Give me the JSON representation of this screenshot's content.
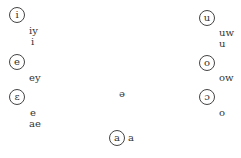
{
  "vowels": {
    "i": {
      "symbol": "i",
      "labels": [
        "iy",
        "i"
      ]
    },
    "e": {
      "symbol": "e",
      "labels": [
        "ey"
      ]
    },
    "eh": {
      "symbol": "ɛ",
      "labels": [
        "e",
        "ae"
      ]
    },
    "u": {
      "symbol": "u",
      "labels": [
        "uw",
        "u"
      ]
    },
    "o": {
      "symbol": "o",
      "labels": [
        "ow"
      ]
    },
    "oh": {
      "symbol": "ɔ",
      "labels": [
        "o"
      ]
    },
    "a": {
      "symbol": "a",
      "labels": [
        "a"
      ]
    },
    "schwa": {
      "symbol": "ə"
    }
  }
}
